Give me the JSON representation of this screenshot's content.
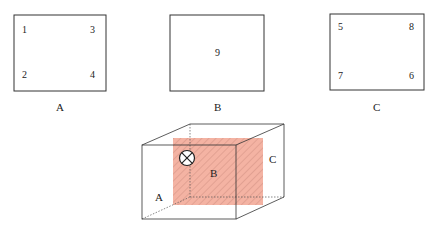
{
  "panels": [
    {
      "label": "A",
      "numbers": {
        "top_left": "1",
        "top_right": "3",
        "bottom_left": "2",
        "bottom_right": "4"
      }
    },
    {
      "label": "B",
      "numbers": {
        "center": "9"
      }
    },
    {
      "label": "C",
      "numbers": {
        "top_left": "5",
        "top_right": "8",
        "bottom_left": "7",
        "bottom_right": "6"
      }
    }
  ],
  "cube": {
    "labels": {
      "face_a": "A",
      "face_b": "B",
      "face_c": "C"
    },
    "shaded_face_color": "#f4b3a3",
    "hatch_color": "#c98878",
    "symbol": "circle-x (into page)"
  }
}
